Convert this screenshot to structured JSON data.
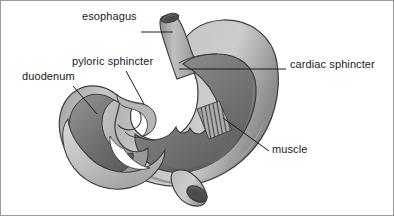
{
  "figure": {
    "background_color": "#ffffff",
    "border_color": "#9a9a9a",
    "labels": {
      "esophagus": "esophagus",
      "pyloric_sphincter": "pyloric sphincter",
      "duodenum": "duodenum",
      "cardiac_sphincter": "cardiac sphincter",
      "muscle": "muscle"
    },
    "colors": {
      "outline": "#3c3c3c",
      "wall_light": "#cdcdcd",
      "wall_mid": "#a8a8a8",
      "wall_dark": "#8a8a8a",
      "interior_light": "#8d8d8d",
      "interior_dark": "#5f5f5f",
      "lumen_dark": "#4a4a4a",
      "leader_line": "#1a1a1a",
      "text": "#1a1a1a"
    }
  }
}
